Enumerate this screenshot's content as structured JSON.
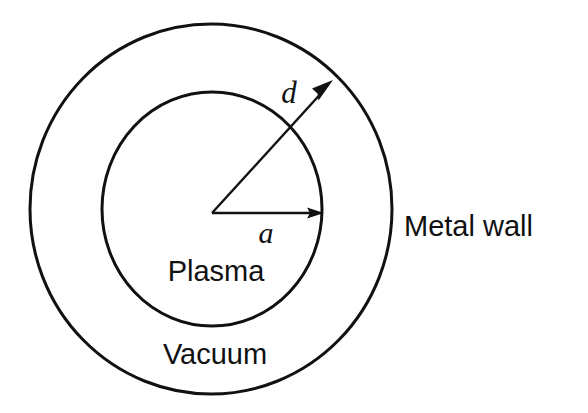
{
  "diagram": {
    "type": "cross-section-schematic",
    "background_color": "#ffffff",
    "line_color": "#111111",
    "labels": {
      "plasma": "Plasma",
      "vacuum": "Vacuum",
      "metal_wall": "Metal wall",
      "inner_radius_symbol": "a",
      "outer_radius_symbol": "d"
    },
    "regions": [
      {
        "name": "plasma",
        "label": "Plasma",
        "shape": "ellipse",
        "center": [
          212,
          209
        ],
        "rx": 110,
        "ry": 117,
        "label_position": [
          216,
          281
        ]
      },
      {
        "name": "vacuum",
        "label": "Vacuum",
        "shape": "annulus",
        "center": [
          211,
          209
        ],
        "inner_rx": 110,
        "inner_ry": 117,
        "outer_rx": 181,
        "outer_ry": 185,
        "label_position": [
          215,
          364
        ]
      },
      {
        "name": "metal-wall",
        "label": "Metal wall",
        "shape": "ellipse-boundary",
        "center": [
          211,
          209
        ],
        "rx": 181,
        "ry": 185,
        "label_position": [
          404,
          236
        ]
      }
    ],
    "arrows": [
      {
        "name": "radius-a",
        "symbol": "a",
        "from": [
          212,
          213
        ],
        "to": [
          322,
          213
        ],
        "symbol_position": [
          266,
          243
        ],
        "describes": "plasma radius"
      },
      {
        "name": "radius-d",
        "symbol": "d",
        "from": [
          212,
          213
        ],
        "to": [
          331,
          82
        ],
        "symbol_position": [
          289,
          103
        ],
        "describes": "metal wall radius"
      }
    ],
    "stroke_widths": {
      "boundary": 3.0,
      "arrow": 2.4
    },
    "font_sizes": {
      "region_label": 29,
      "symbol_label": 30
    }
  }
}
